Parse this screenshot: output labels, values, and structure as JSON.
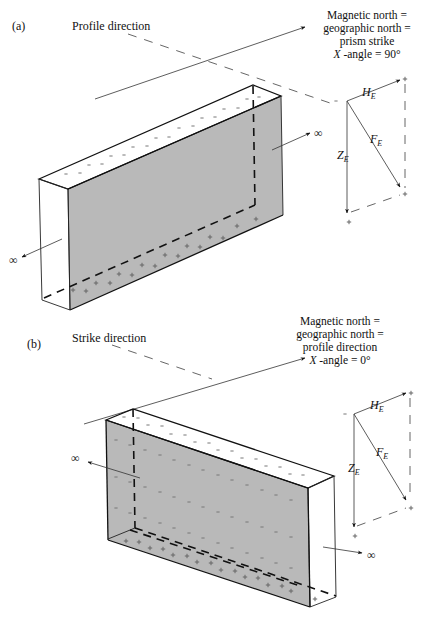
{
  "panels": [
    {
      "id": "a",
      "label": "(a)",
      "direction_label": "Profile direction",
      "north_note": {
        "lines": [
          "Magnetic north =",
          "geographic north =",
          "prism strike"
        ],
        "angle_symbol": "X",
        "angle_text": " -angle = 90°"
      },
      "infinity_right": "∞",
      "infinity_left": "∞",
      "vectors": {
        "horizontal": {
          "symbol": "H",
          "sub": "E"
        },
        "total": {
          "symbol": "F",
          "sub": "E"
        },
        "vertical": {
          "symbol": "Z",
          "sub": "E"
        }
      },
      "pole_signs": {
        "top": "−",
        "bottom": "+"
      }
    },
    {
      "id": "b",
      "label": "(b)",
      "direction_label": "Strike direction",
      "north_note": {
        "lines": [
          "Magnetic north =",
          "geographic north =",
          "profile direction"
        ],
        "angle_symbol": "X",
        "angle_text": " -angle = 0°"
      },
      "infinity_right": "∞",
      "infinity_left": "∞",
      "vectors": {
        "horizontal": {
          "symbol": "H",
          "sub": "E"
        },
        "total": {
          "symbol": "F",
          "sub": "E"
        },
        "vertical": {
          "symbol": "Z",
          "sub": "E"
        }
      },
      "pole_signs": {
        "top": "−",
        "bottom": "+"
      }
    }
  ],
  "colors": {
    "prism_face": "#b9b9b9",
    "line": "#111111",
    "background": "#ffffff"
  }
}
